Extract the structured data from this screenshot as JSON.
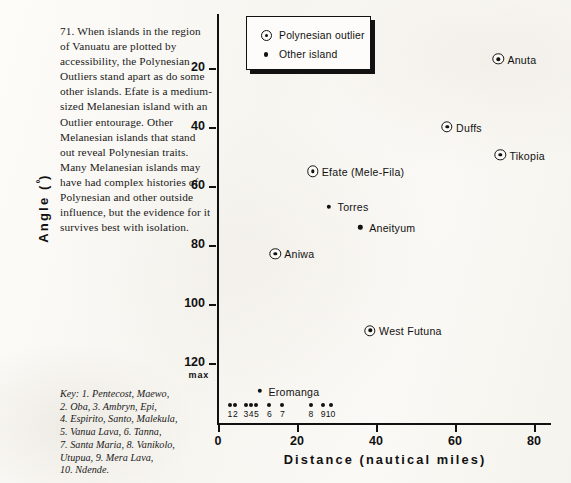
{
  "caption": {
    "text": "71. When islands in the region of Vanuatu are plotted by accessibility, the Polynesian Outliers stand apart as do some other islands. Efate is a medium-sized Melanesian island with an Outlier entourage. Other Melanesian islands that stand out reveal Polynesian traits. Many Melanesian islands may have had complex histories of Polynesian and other outside influence, but the evidence for it survives best with isolation."
  },
  "key": {
    "lines": [
      "Key: 1. Pentecost, Maewo,",
      "2. Oba, 3. Ambryn, Epi,",
      "4. Espirito, Santo, Malekula,",
      "5. Vanua Lava, 6. Tanna,",
      "7. Santa Maria, 8. Vanikolo,",
      "Utupua, 9. Mera Lava,",
      "10. Ndende."
    ]
  },
  "legend": {
    "entries": [
      {
        "label": "Polynesian outlier",
        "marker": "ring-dot-marker"
      },
      {
        "label": "Other island",
        "marker": "dot-marker"
      }
    ]
  },
  "chart_data": {
    "type": "scatter",
    "title": "",
    "xlabel": "Distance (nautical miles)",
    "ylabel": "Angle (º)",
    "xlim": [
      0,
      84
    ],
    "ylim": [
      0,
      132
    ],
    "y_inverted": true,
    "xticks": [
      0,
      20,
      40,
      60,
      80
    ],
    "xtick_labels": [
      "0",
      "20",
      "40",
      "60",
      "80"
    ],
    "yticks": [
      20,
      40,
      60,
      80,
      100,
      120
    ],
    "ytick_labels": [
      "20",
      "40",
      "60",
      "80",
      "100",
      "120"
    ],
    "y_max_note": "max",
    "grid": false,
    "legend_position": "top-left-inside",
    "series": [
      {
        "name": "Polynesian outlier",
        "marker": "ring-dot-marker",
        "points": [
          {
            "label": "Anuta",
            "x": 71.0,
            "y": 17.0,
            "label_side": "right"
          },
          {
            "label": "Duffs",
            "x": 58.0,
            "y": 40.0,
            "label_side": "right"
          },
          {
            "label": "Tikopia",
            "x": 71.5,
            "y": 49.5,
            "label_side": "right"
          },
          {
            "label": "Efate (Mele-Fila)",
            "x": 24.0,
            "y": 55.0,
            "label_side": "right"
          },
          {
            "label": "Aniwa",
            "x": 14.5,
            "y": 83.0,
            "label_side": "right"
          },
          {
            "label": "West Futuna",
            "x": 38.5,
            "y": 109.0,
            "label_side": "right"
          }
        ]
      },
      {
        "name": "Other island",
        "marker": "dot-marker",
        "points": [
          {
            "label": "Torres",
            "x": 28.0,
            "y": 67.0,
            "label_side": "right"
          },
          {
            "label": "Aneityum",
            "x": 36.0,
            "y": 74.0,
            "label_side": "right"
          },
          {
            "label": "Eromanga",
            "x": 10.5,
            "y": 129.5,
            "label_side": "right"
          }
        ]
      },
      {
        "name": "Numbered islands at maximum angle",
        "marker": "dot-marker",
        "at_max_angle": true,
        "points": [
          {
            "label": "1",
            "x": 3.0,
            "y": 120.0,
            "name": "Pentecost, Maewo"
          },
          {
            "label": "2",
            "x": 4.4,
            "y": 120.0,
            "name": "Oba"
          },
          {
            "label": "3",
            "x": 7.1,
            "y": 120.0,
            "name": "Ambryn, Epi"
          },
          {
            "label": "4",
            "x": 8.4,
            "y": 120.0,
            "name": "Espirito, Santo, Malekula"
          },
          {
            "label": "5",
            "x": 9.7,
            "y": 120.0,
            "name": "Vanua Lava"
          },
          {
            "label": "6",
            "x": 13.0,
            "y": 120.0,
            "name": "Tanna"
          },
          {
            "label": "7",
            "x": 16.3,
            "y": 120.0,
            "name": "Santa Maria"
          },
          {
            "label": "8",
            "x": 23.5,
            "y": 120.0,
            "name": "Vanikolo, Utupua"
          },
          {
            "label": "9",
            "x": 26.6,
            "y": 120.0,
            "name": "Mera Lava"
          },
          {
            "label": "10",
            "x": 28.5,
            "y": 120.0,
            "name": "Ndende"
          }
        ]
      }
    ]
  }
}
